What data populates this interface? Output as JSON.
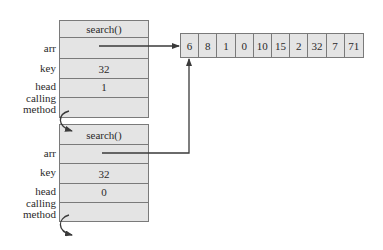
{
  "frames": [
    {
      "header": "search()",
      "rows": [
        {
          "label": "arr",
          "value": ""
        },
        {
          "label": "key",
          "value": "32"
        },
        {
          "label": "head",
          "value": "1"
        },
        {
          "label_line1": "calling",
          "label_line2": "method",
          "value": ""
        }
      ]
    },
    {
      "header": "search()",
      "rows": [
        {
          "label": "arr",
          "value": ""
        },
        {
          "label": "key",
          "value": "32"
        },
        {
          "label": "head",
          "value": "0"
        },
        {
          "label_line1": "calling",
          "label_line2": "method",
          "value": ""
        }
      ]
    }
  ],
  "array": {
    "values": [
      "6",
      "8",
      "1",
      "0",
      "10",
      "15",
      "2",
      "32",
      "7",
      "71"
    ]
  },
  "colors": {
    "cell_fill": "#e4e4e4",
    "border": "#7a7a7a",
    "line": "#3a3a3a"
  }
}
